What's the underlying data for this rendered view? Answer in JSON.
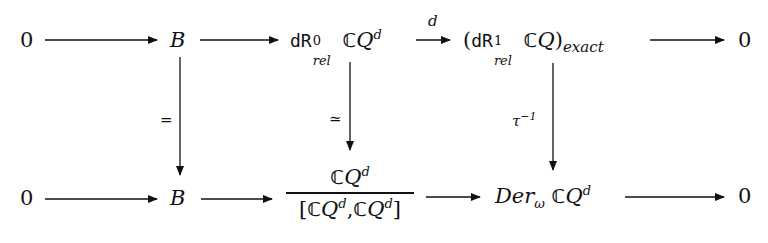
{
  "diagram": {
    "type": "commutative-diagram",
    "top_row": {
      "n0": "0",
      "n1": "B",
      "n2": {
        "prefix": "dR",
        "sup": "0",
        "sub": "rel",
        "space": "ℂ",
        "var": "Q",
        "var_sup": "d"
      },
      "n3": {
        "open": "(",
        "prefix": "dR",
        "sup": "1",
        "sub": "rel",
        "space": "ℂ",
        "var": "Q",
        "close": ")",
        "close_sub": "exact"
      },
      "n4": "0",
      "arrow_labels": {
        "n2_to_n3": "d"
      }
    },
    "bottom_row": {
      "n0": "0",
      "n1": "B",
      "n2": {
        "numerator": {
          "space": "ℂ",
          "var": "Q",
          "var_sup": "d"
        },
        "denominator": {
          "open": "[",
          "space1": "ℂ",
          "var1": "Q",
          "sup1": "d",
          "comma": ",",
          "space2": "ℂ",
          "var2": "Q",
          "sup2": "d",
          "close": "]"
        }
      },
      "n3": {
        "name": "Der",
        "sub": "ω",
        "space": "ℂ",
        "var": "Q",
        "var_sup": "d"
      },
      "n4": "0"
    },
    "vertical_arrows": {
      "left": {
        "label": "="
      },
      "middle": {
        "label": "≃"
      },
      "right": {
        "label": "τ",
        "label_sup": "−1"
      }
    }
  }
}
